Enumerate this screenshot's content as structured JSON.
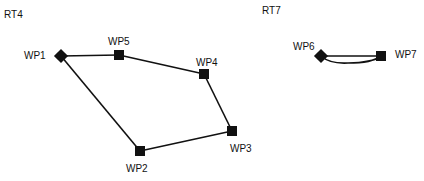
{
  "routes": [
    {
      "id": "RT4",
      "title": "RT4",
      "waypoints": [
        {
          "id": "WP1",
          "label": "WP1",
          "shape": "diamond"
        },
        {
          "id": "WP5",
          "label": "WP5",
          "shape": "square"
        },
        {
          "id": "WP4",
          "label": "WP4",
          "shape": "square"
        },
        {
          "id": "WP3",
          "label": "WP3",
          "shape": "square"
        },
        {
          "id": "WP2",
          "label": "WP2",
          "shape": "square"
        }
      ],
      "edges": [
        [
          "WP1",
          "WP5"
        ],
        [
          "WP5",
          "WP4"
        ],
        [
          "WP4",
          "WP3"
        ],
        [
          "WP3",
          "WP2"
        ],
        [
          "WP2",
          "WP1"
        ]
      ]
    },
    {
      "id": "RT7",
      "title": "RT7",
      "waypoints": [
        {
          "id": "WP6",
          "label": "WP6",
          "shape": "diamond"
        },
        {
          "id": "WP7",
          "label": "WP7",
          "shape": "square"
        }
      ],
      "edges": [
        [
          "WP6",
          "WP7",
          "straight"
        ],
        [
          "WP7",
          "WP6",
          "curved"
        ]
      ]
    }
  ]
}
